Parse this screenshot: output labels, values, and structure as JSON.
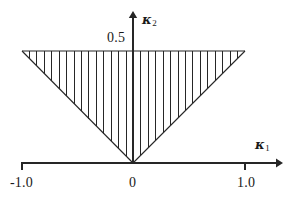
{
  "figure": {
    "background_color": "#ffffff",
    "ink_color": "#262626",
    "width": 293,
    "height": 205
  },
  "axes": {
    "x": {
      "title": "κ",
      "title_subscript": "1",
      "title_full": "κ₁",
      "tick_labels": [
        "-1.0",
        "0",
        "1.0"
      ],
      "tick_values": [
        -1.0,
        0.0,
        1.0
      ],
      "range": [
        -1.0,
        1.0
      ],
      "arrow": "right"
    },
    "y": {
      "title": "κ",
      "title_subscript": "2",
      "title_full": "κ₂",
      "tick_labels": [
        "0.5"
      ],
      "tick_values": [
        0.5
      ],
      "range": [
        0.0,
        0.5
      ],
      "arrow": "up"
    }
  },
  "chart_data": {
    "type": "line",
    "title": "",
    "xlabel": "κ₁",
    "ylabel": "κ₂",
    "xlim": [
      -1.0,
      1.0
    ],
    "ylim": [
      0.0,
      0.5
    ],
    "grid": false,
    "legend": null,
    "series": [
      {
        "name": "region-boundary",
        "kind": "closed-polygon",
        "fill": "vertical-hatch",
        "x": [
          -1.0,
          1.0,
          0.0,
          -1.0
        ],
        "y": [
          0.5,
          0.5,
          0.0,
          0.5
        ]
      }
    ],
    "annotations": [
      {
        "text": "0.5",
        "x": -0.12,
        "y": 0.5,
        "role": "y-tick-label"
      },
      {
        "text": "-1.0",
        "x": -1.0,
        "y": -0.06,
        "role": "x-tick-label"
      },
      {
        "text": "0",
        "x": 0.0,
        "y": -0.06,
        "role": "x-tick-label"
      },
      {
        "text": "1.0",
        "x": 1.0,
        "y": -0.06,
        "role": "x-tick-label"
      },
      {
        "text": "κ₂",
        "x": 0.1,
        "y": 0.67,
        "role": "y-axis-title"
      },
      {
        "text": "κ₁",
        "x": 1.12,
        "y": 0.09,
        "role": "x-axis-title"
      }
    ],
    "hatch": {
      "orientation": "vertical",
      "line_count": 30,
      "spacing_px": 7.4
    }
  }
}
